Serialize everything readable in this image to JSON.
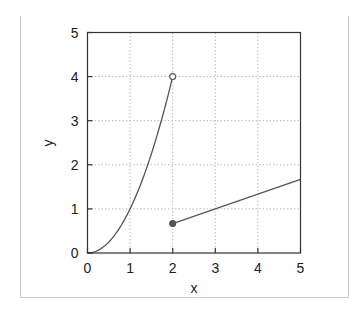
{
  "chart_data": {
    "type": "line",
    "title": "",
    "xlabel": "x",
    "ylabel": "y",
    "xlim": [
      0,
      5
    ],
    "ylim": [
      0,
      5
    ],
    "xticks": [
      "0",
      "1",
      "2",
      "3",
      "4",
      "5"
    ],
    "yticks": [
      "0",
      "1",
      "2",
      "3",
      "4",
      "5"
    ],
    "grid": true,
    "legend": null,
    "series": [
      {
        "name": "y = x^2",
        "domain": [
          0,
          2
        ],
        "x": [
          0,
          0.25,
          0.5,
          0.75,
          1,
          1.25,
          1.5,
          1.75,
          2
        ],
        "y": [
          0,
          0.0625,
          0.25,
          0.5625,
          1,
          1.5625,
          2.25,
          3.0625,
          4
        ],
        "endpoint": {
          "x": 2,
          "y": 4,
          "marker": "open-circle"
        }
      },
      {
        "name": "y = x/3",
        "domain": [
          2,
          5
        ],
        "x": [
          2,
          5
        ],
        "y": [
          0.667,
          1.667
        ],
        "endpoint": {
          "x": 2,
          "y": 0.667,
          "marker": "filled-circle"
        }
      }
    ],
    "colors": {
      "line": "#555555",
      "axes": "#333333",
      "grid": "#bbbbbb",
      "frame": "#cccccc"
    }
  }
}
